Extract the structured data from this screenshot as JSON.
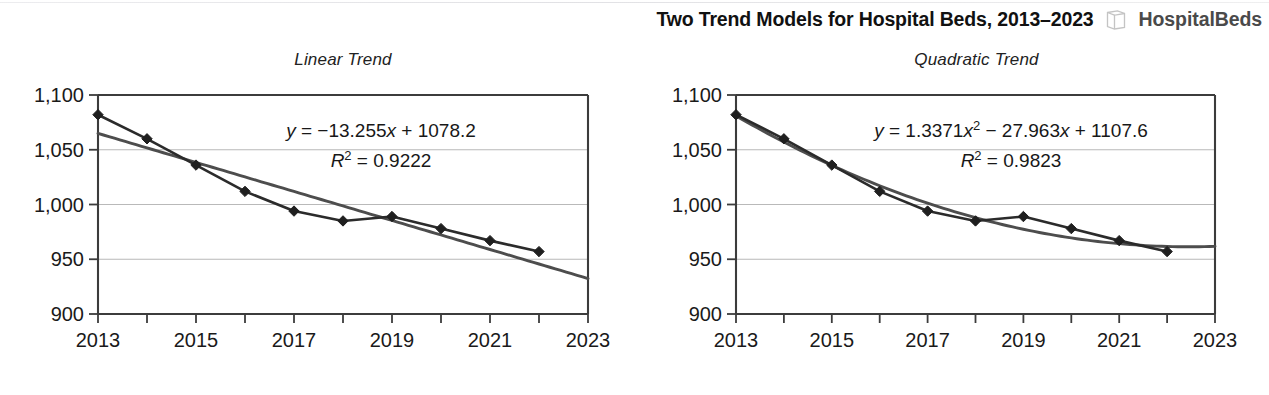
{
  "header": {
    "figure_title": "Two Trend Models for Hospital Beds, 2013–2023",
    "file_icon": "file-document-icon",
    "workbook_name": "HospitalBeds"
  },
  "chart_data": [
    {
      "id": "linear",
      "type": "line",
      "title": "Linear Trend",
      "xlabel": "",
      "ylabel": "",
      "x": [
        2013,
        2014,
        2015,
        2016,
        2017,
        2018,
        2019,
        2020,
        2021,
        2022
      ],
      "values": [
        1082,
        1060,
        1036,
        1012,
        994,
        985,
        989,
        978,
        967,
        957
      ],
      "series": [
        {
          "name": "Hospital Beds",
          "values": [
            1082,
            1060,
            1036,
            1012,
            994,
            985,
            989,
            978,
            967,
            957
          ]
        }
      ],
      "trendline": {
        "kind": "linear",
        "slope": -13.255,
        "intercept": 1078.2,
        "equation": "y = −13.255x + 1078.2",
        "r_squared_label": "R² = 0.9222",
        "r_squared": 0.9222
      },
      "xlim": [
        2013,
        2023
      ],
      "ylim": [
        900,
        1100
      ],
      "xticks": [
        2013,
        2014,
        2015,
        2016,
        2017,
        2018,
        2019,
        2020,
        2021,
        2022,
        2023
      ],
      "xtick_labels": [
        "2013",
        "",
        "2015",
        "",
        "2017",
        "",
        "2019",
        "",
        "2021",
        "",
        "2023"
      ],
      "yticks": [
        900,
        950,
        1000,
        1050,
        1100
      ],
      "ytick_labels": [
        "900",
        "950",
        "1,000",
        "1,050",
        "1,100"
      ],
      "grid": true,
      "legend": "none",
      "marker": "diamond"
    },
    {
      "id": "quadratic",
      "type": "line",
      "title": "Quadratic Trend",
      "xlabel": "",
      "ylabel": "",
      "x": [
        2013,
        2014,
        2015,
        2016,
        2017,
        2018,
        2019,
        2020,
        2021,
        2022
      ],
      "values": [
        1082,
        1060,
        1036,
        1012,
        994,
        985,
        989,
        978,
        967,
        957
      ],
      "series": [
        {
          "name": "Hospital Beds",
          "values": [
            1082,
            1060,
            1036,
            1012,
            994,
            985,
            989,
            978,
            967,
            957
          ]
        }
      ],
      "trendline": {
        "kind": "quadratic",
        "a": 1.3371,
        "b": -27.963,
        "c": 1107.6,
        "equation": "y = 1.3371x² − 27.963x + 1107.6",
        "r_squared_label": "R² = 0.9823",
        "r_squared": 0.9823
      },
      "xlim": [
        2013,
        2023
      ],
      "ylim": [
        900,
        1100
      ],
      "xticks": [
        2013,
        2014,
        2015,
        2016,
        2017,
        2018,
        2019,
        2020,
        2021,
        2022,
        2023
      ],
      "xtick_labels": [
        "2013",
        "",
        "2015",
        "",
        "2017",
        "",
        "2019",
        "",
        "2021",
        "",
        "2023"
      ],
      "yticks": [
        900,
        950,
        1000,
        1050,
        1100
      ],
      "ytick_labels": [
        "900",
        "950",
        "1,000",
        "1,050",
        "1,100"
      ],
      "grid": true,
      "legend": "none",
      "marker": "diamond"
    }
  ],
  "colors": {
    "data_line": "#2b2b2b",
    "trend_line": "#4d4d4d",
    "gridline": "#b9b9b9",
    "axis": "#3c3c3c",
    "background": "#ffffff"
  }
}
